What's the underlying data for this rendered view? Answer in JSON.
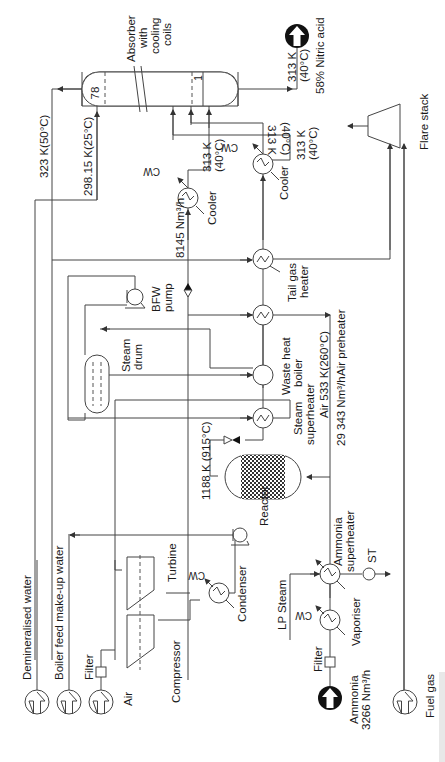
{
  "diagram": {
    "orientation": "rotated-90",
    "labels": {
      "absorber": [
        "Absorber",
        "with",
        "cooling",
        "coils"
      ],
      "absorber_tray_top": "78",
      "absorber_tray_bottom": "1",
      "nitric_acid_temp": [
        "313 K",
        "(40°C)"
      ],
      "nitric_acid_product": "58% Nitric acid",
      "flare_stack": "Flare stack",
      "stream_323": "323 K(50°C)",
      "stream_298": "298.15 K(25°C)",
      "cooler1_temp": [
        "313 K",
        "(40°C)"
      ],
      "cooler2_temp": [
        "313 K",
        "(40°C)"
      ],
      "loop_temp": [
        "313 K",
        "(40°C)"
      ],
      "cooler1": "Cooler",
      "cooler2": "Cooler",
      "cw1": "CW",
      "cw2": "CW",
      "cw3": "CW",
      "cw4": "CW",
      "flow_8145": "8145 Nm³/h",
      "tail_gas_heater": [
        "Tail gas",
        "heater"
      ],
      "bfw_pump": [
        "BFW",
        "pump"
      ],
      "air_preheater": "Air preheater",
      "air_533": "Air 533 K(260°C)",
      "flow_29343": "29 343 Nm³/h",
      "steam_drum": [
        "Steam",
        "drum"
      ],
      "waste_heat_boiler": [
        "Waste heat",
        "boiler"
      ],
      "steam_superheater": [
        "Steam",
        "superheater"
      ],
      "reactor_temp": "1188 K (915°C)",
      "reactor": "Reactor",
      "ammonia_superheater": [
        "Ammonia",
        "superheater"
      ],
      "st": "ST",
      "turbine": "Turbine",
      "condenser": "Condenser",
      "compressor": "Compressor",
      "lp_steam": "LP Steam",
      "vaporiser": "Vaporiser",
      "filter_air": "Filter",
      "filter_ammonia": "Filter",
      "air": "Air",
      "demineralised_water": "Demineralised water",
      "boiler_feed_water": "Boiler feed make-up water",
      "ammonia_feed": [
        "Ammonia",
        "3266 Nm³/h"
      ],
      "fuel_gas": "Fuel gas"
    },
    "colors": {
      "line": "#444444",
      "text": "#1a1a1a",
      "product_fill": "#111111",
      "background": "#ffffff"
    }
  }
}
